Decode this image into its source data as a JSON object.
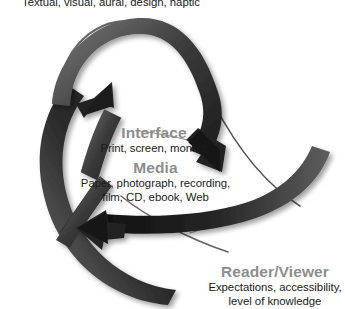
{
  "diagram": {
    "title_caption": "Textual, visual, aural, design, haptic",
    "type": "cyclic-triangle-arrow-diagram",
    "background_color": "#ffffff",
    "heading_color": "#8d8d8d",
    "body_text_color": "#1a1a1a",
    "arrow_color": "#3a3a3a",
    "nodes": [
      {
        "id": "interface",
        "heading": "Interface",
        "description_lines": [
          "Print, screen, monitor"
        ]
      },
      {
        "id": "media",
        "heading": "Media",
        "description_lines": [
          "Paper, photograph, recording,",
          "film, CD, ebook, Web"
        ]
      },
      {
        "id": "reader_viewer",
        "heading": "Reader/Viewer",
        "description_lines": [
          "Expectations, accessibility,",
          "level of knowledge"
        ]
      }
    ],
    "arrows": [
      {
        "id": "arrow-upper-left",
        "direction": "up-right",
        "label": "curved arrow pointing up-right"
      },
      {
        "id": "arrow-upper-right",
        "direction": "down-right",
        "label": "curved arrow pointing down-right"
      },
      {
        "id": "arrow-bottom",
        "direction": "left",
        "label": "curved arrow pointing left"
      }
    ]
  }
}
